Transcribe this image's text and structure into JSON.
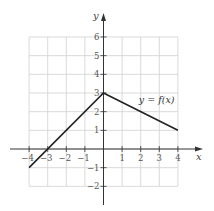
{
  "chart_data": {
    "type": "line",
    "title": "",
    "xlabel": "x",
    "ylabel": "y",
    "xlim": [
      -4,
      4
    ],
    "ylim": [
      -2,
      6
    ],
    "grid": true,
    "x_ticks": [
      -4,
      -3,
      -2,
      -1,
      1,
      2,
      3,
      4
    ],
    "y_ticks": [
      -2,
      -1,
      1,
      2,
      3,
      4,
      5,
      6
    ],
    "series": [
      {
        "name": "y = f(x)",
        "points": [
          [
            -4,
            -1
          ],
          [
            0,
            3
          ],
          [
            4,
            1
          ]
        ],
        "color": "#222222"
      }
    ],
    "annotations": [
      {
        "text": "y = f(x)",
        "x": 2.6,
        "y": 2.6
      }
    ]
  },
  "labels": {
    "x_axis": "x",
    "y_axis": "y",
    "function": "y = f(x)"
  },
  "colors": {
    "grid": "#d0d0d0",
    "axis": "#333333",
    "curve": "#222222"
  }
}
